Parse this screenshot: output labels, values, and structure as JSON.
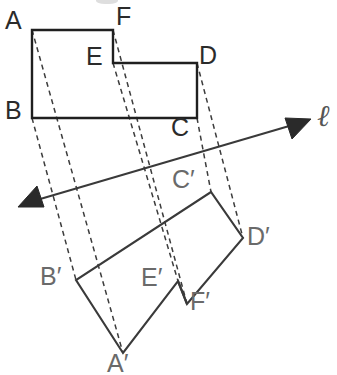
{
  "figure": {
    "type": "geometry-diagram",
    "canvas": {
      "width": 337,
      "height": 375
    },
    "colors": {
      "stroke_dark": "#1f1f1f",
      "stroke": "#3a3a3a",
      "dashed": "#3c3c3c",
      "label": "#2b2b2b",
      "label_faded": "#6a6a6a",
      "line_label": "#555555",
      "background": "#ffffff"
    },
    "preimage": {
      "name": "ABCDEF",
      "vertices": [
        {
          "id": "A",
          "label": "A",
          "x": 32,
          "y": 30,
          "label_x": 5,
          "label_y": 8
        },
        {
          "id": "F",
          "label": "F",
          "x": 113,
          "y": 30,
          "label_x": 116,
          "label_y": 6
        },
        {
          "id": "E",
          "label": "E",
          "x": 113,
          "y": 63,
          "label_x": 86,
          "label_y": 45
        },
        {
          "id": "D",
          "label": "D",
          "x": 197,
          "y": 63,
          "label_x": 199,
          "label_y": 44
        },
        {
          "id": "C",
          "label": "C",
          "x": 197,
          "y": 118,
          "label_x": 171,
          "label_y": 116
        },
        {
          "id": "B",
          "label": "B",
          "x": 32,
          "y": 118,
          "label_x": 5,
          "label_y": 99
        }
      ]
    },
    "image": {
      "name": "A'B'C'D'E'F'",
      "vertices": [
        {
          "id": "Ap",
          "label": "A′",
          "x": 123,
          "y": 353,
          "label_x": 108,
          "label_y": 352
        },
        {
          "id": "Bp",
          "label": "B′",
          "x": 76,
          "y": 280,
          "label_x": 41,
          "label_y": 265
        },
        {
          "id": "Cp",
          "label": "C′",
          "x": 211,
          "y": 192,
          "label_x": 172,
          "label_y": 168
        },
        {
          "id": "Dp",
          "label": "D′",
          "x": 243,
          "y": 238,
          "label_x": 247,
          "label_y": 225
        },
        {
          "id": "Ep",
          "label": "E′",
          "x": 178,
          "y": 281,
          "label_x": 141,
          "label_y": 266
        },
        {
          "id": "Fp",
          "label": "F′",
          "x": 187,
          "y": 304,
          "label_x": 190,
          "label_y": 290
        }
      ]
    },
    "reflection_line": {
      "label": "ℓ",
      "label_x": 318,
      "label_y": 104,
      "start_x": 22,
      "start_y": 205,
      "end_x": 310,
      "end_y": 120,
      "double_headed": true
    },
    "connector_pairs": [
      {
        "from": "A",
        "to": "Ap"
      },
      {
        "from": "B",
        "to": "Bp"
      },
      {
        "from": "C",
        "to": "Cp"
      },
      {
        "from": "D",
        "to": "Dp"
      },
      {
        "from": "E",
        "to": "Ep"
      },
      {
        "from": "F",
        "to": "Fp"
      }
    ]
  }
}
